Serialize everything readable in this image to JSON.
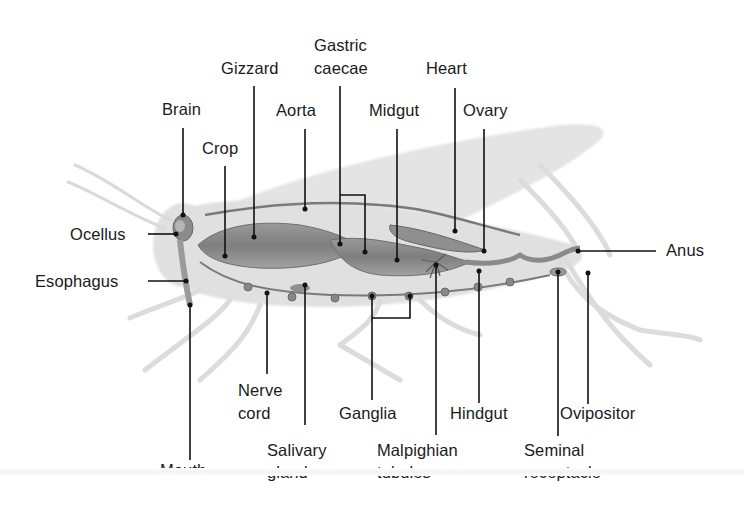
{
  "diagram": {
    "labels": {
      "gastric_caecae_l1": "Gastric",
      "gastric_caecae_l2": "caecae",
      "gizzard": "Gizzard",
      "heart": "Heart",
      "brain": "Brain",
      "aorta": "Aorta",
      "midgut": "Midgut",
      "ovary": "Ovary",
      "crop": "Crop",
      "ocellus": "Ocellus",
      "esophagus": "Esophagus",
      "anus": "Anus",
      "nerve_cord_l1": "Nerve",
      "nerve_cord_l2": "cord",
      "ganglia": "Ganglia",
      "hindgut": "Hindgut",
      "ovipositor": "Ovipositor",
      "salivary_gland_l1": "Salivary",
      "salivary_gland_l2": "gland",
      "malpighian_tubules_l1": "Malpighian",
      "malpighian_tubules_l2": "tubules",
      "seminal_receptacle_l1": "Seminal",
      "seminal_receptacle_l2": "receptacle",
      "mouth": "Mouth"
    },
    "colors": {
      "body_silhouette": "#dcdcdc",
      "organs": "#8c8c8c",
      "organs_dark": "#6e6e6e",
      "leader_lines": "#111111",
      "text": "#1a1a1a"
    }
  }
}
